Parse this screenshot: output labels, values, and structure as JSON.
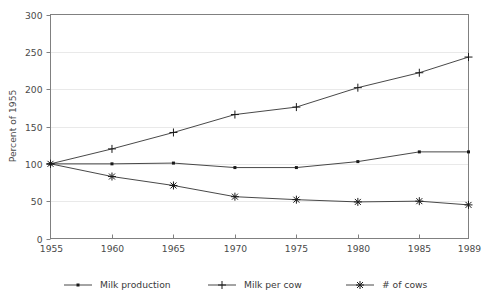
{
  "chart_data": {
    "type": "line",
    "title": "",
    "xlabel": "",
    "ylabel": "Percent of 1955",
    "x": [
      1955,
      1960,
      1965,
      1970,
      1975,
      1980,
      1985,
      1989
    ],
    "xticklabels": [
      "1955",
      "1960",
      "1965",
      "1970",
      "1975",
      "1980",
      "1985",
      "1989"
    ],
    "yticks": [
      0,
      50,
      100,
      150,
      200,
      250,
      300
    ],
    "yticklabels": [
      "0",
      "50",
      "100",
      "150",
      "200",
      "250",
      "300"
    ],
    "xlim": [
      1955,
      1989
    ],
    "ylim": [
      0,
      300
    ],
    "grid": "horizontal",
    "legend_position": "bottom",
    "series": [
      {
        "name": "Milk production",
        "marker": "dot",
        "color": "#333333",
        "values": [
          100,
          100,
          101,
          95,
          95,
          103,
          116,
          116
        ]
      },
      {
        "name": "Milk per cow",
        "marker": "plus",
        "color": "#333333",
        "values": [
          100,
          120,
          142,
          166,
          176,
          202,
          222,
          243
        ]
      },
      {
        "name": "# of cows",
        "marker": "asterisk",
        "color": "#333333",
        "values": [
          100,
          83,
          71,
          56,
          52,
          49,
          50,
          45
        ]
      }
    ]
  },
  "axis": {
    "y_title": "Percent of 1955",
    "y_tick_0": "0",
    "y_tick_1": "50",
    "y_tick_2": "100",
    "y_tick_3": "150",
    "y_tick_4": "200",
    "y_tick_5": "250",
    "y_tick_6": "300",
    "x_tick_0": "1955",
    "x_tick_1": "1960",
    "x_tick_2": "1965",
    "x_tick_3": "1970",
    "x_tick_4": "1975",
    "x_tick_5": "1980",
    "x_tick_6": "1985",
    "x_tick_7": "1989"
  },
  "legend": {
    "item_0": "Milk production",
    "item_1": "Milk per cow",
    "item_2": "# of cows"
  },
  "colors": {
    "line": "#333333",
    "grid": "#e9e9e9",
    "frame": "#808080",
    "text": "#3a3a3a",
    "background": "#ffffff"
  }
}
